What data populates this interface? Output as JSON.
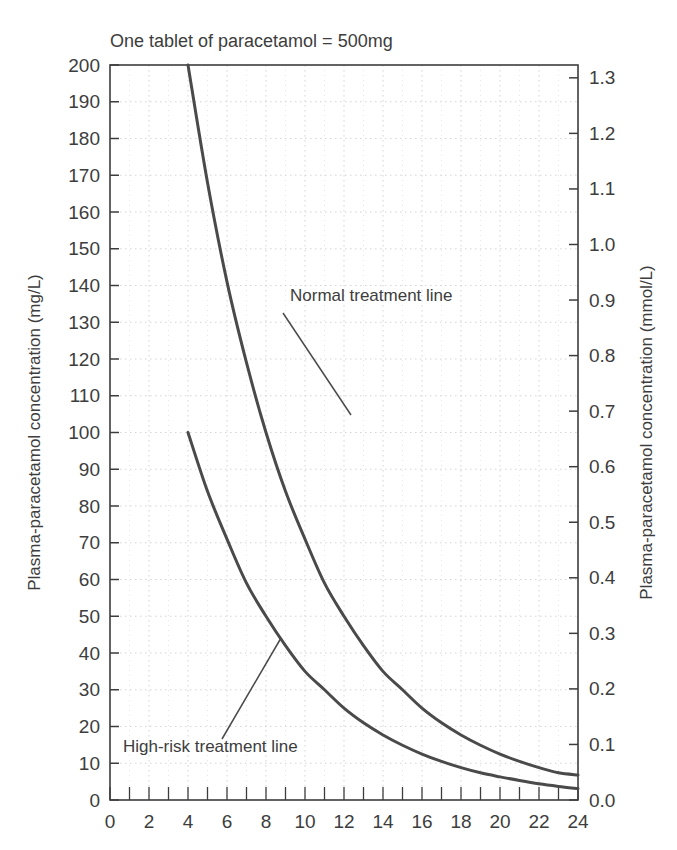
{
  "chart_data": {
    "type": "line",
    "title": "One tablet of paracetamol = 500mg",
    "xlabel": "",
    "ylabel": "Plasma-paracetamol concentration (mg/L)",
    "y2label": "Plasma-paracetamol concentration (mmol/L)",
    "xlim": [
      0,
      24
    ],
    "ylim": [
      0,
      200
    ],
    "y2lim": [
      0.0,
      1.3
    ],
    "grid": true,
    "legend_position": "inline-annotations",
    "x_ticks": [
      0,
      2,
      4,
      6,
      8,
      10,
      12,
      14,
      16,
      18,
      20,
      22,
      24
    ],
    "x_tick_labels": [
      "0",
      "2",
      "4",
      "6",
      "8",
      "10",
      "12",
      "14",
      "16",
      "18",
      "20",
      "22",
      "24"
    ],
    "x_minor_tick_step": 1,
    "y_ticks": [
      0,
      10,
      20,
      30,
      40,
      50,
      60,
      70,
      80,
      90,
      100,
      110,
      120,
      130,
      140,
      150,
      160,
      170,
      180,
      190,
      200
    ],
    "y_tick_labels": [
      "0",
      "10",
      "20",
      "30",
      "40",
      "50",
      "60",
      "70",
      "80",
      "90",
      "100",
      "110",
      "120",
      "130",
      "140",
      "150",
      "160",
      "170",
      "180",
      "190",
      "200"
    ],
    "y2_ticks": [
      0.0,
      0.1,
      0.2,
      0.3,
      0.4,
      0.5,
      0.6,
      0.7,
      0.8,
      0.9,
      1.0,
      1.1,
      1.2,
      1.3
    ],
    "y2_tick_labels": [
      "0.0",
      "0.1",
      "0.2",
      "0.3",
      "0.4",
      "0.5",
      "0.6",
      "0.7",
      "0.8",
      "0.9",
      "1.0",
      "1.1",
      "1.2",
      "1.3"
    ],
    "line_color": "#4a4a4a",
    "grid_color": "#c9c9cf",
    "axis_color": "#3d3d3d",
    "series": [
      {
        "name": "Normal treatment line",
        "x": [
          4,
          5,
          6,
          7,
          8,
          9,
          10,
          11,
          12,
          13,
          14,
          15,
          16,
          17,
          18,
          19,
          20,
          21,
          22,
          23,
          24
        ],
        "values": [
          200,
          168,
          141,
          119,
          100,
          84,
          71,
          59,
          50,
          42,
          35,
          30,
          25,
          21,
          17.7,
          14.9,
          12.5,
          10.5,
          8.8,
          7.4,
          6.8
        ]
      },
      {
        "name": "High-risk treatment line",
        "x": [
          4,
          5,
          6,
          7,
          8,
          9,
          10,
          11,
          12,
          13,
          14,
          15,
          16,
          17,
          18,
          19,
          20,
          21,
          22,
          23,
          24
        ],
        "values": [
          100,
          84,
          71,
          59,
          50,
          42,
          35,
          30,
          25,
          21,
          17.7,
          14.9,
          12.5,
          10.5,
          8.8,
          7.4,
          6.3,
          5.3,
          4.4,
          3.7,
          3.1
        ]
      }
    ],
    "annotations": [
      {
        "text": "Normal treatment line",
        "label_x_px": 290,
        "label_y_px": 301,
        "leader_from_px": [
          283,
          313
        ],
        "leader_to_px": [
          351,
          415
        ]
      },
      {
        "text": "High-risk treatment line",
        "label_x_px": 123,
        "label_y_px": 752,
        "leader_from_px": [
          222,
          739
        ],
        "leader_to_px": [
          281,
          638
        ]
      }
    ]
  }
}
